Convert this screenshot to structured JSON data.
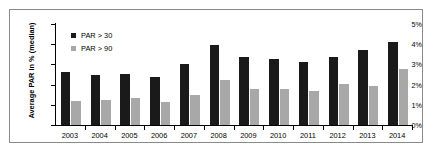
{
  "chart_data": {
    "type": "bar",
    "title": "",
    "xlabel": "",
    "ylabel": "Average PAR in % (median)",
    "categories": [
      "2003",
      "2004",
      "2005",
      "2006",
      "2007",
      "2008",
      "2009",
      "2010",
      "2011",
      "2012",
      "2013",
      "2014"
    ],
    "series": [
      {
        "name": "PAR > 30",
        "color": "#1a1a1a",
        "values": [
          2.6,
          2.5,
          2.55,
          2.4,
          3.0,
          3.95,
          3.35,
          3.25,
          3.1,
          3.35,
          3.7,
          4.1
        ]
      },
      {
        "name": "PAR > 90",
        "color": "#a8a8a8",
        "values": [
          1.2,
          1.25,
          1.35,
          1.15,
          1.5,
          2.25,
          1.8,
          1.8,
          1.7,
          2.05,
          1.95,
          2.75
        ]
      }
    ],
    "ylim": [
      0,
      5
    ],
    "ytick_values": [
      0,
      1,
      2,
      3,
      4,
      5
    ],
    "ytick_labels": [
      "0%",
      "1%",
      "2%",
      "3%",
      "4%",
      "5%"
    ],
    "grid": false,
    "legend_position": "top-left",
    "frame": true
  },
  "legend": {
    "entries": [
      {
        "label": "PAR > 30"
      },
      {
        "label": "PAR > 90"
      }
    ]
  }
}
